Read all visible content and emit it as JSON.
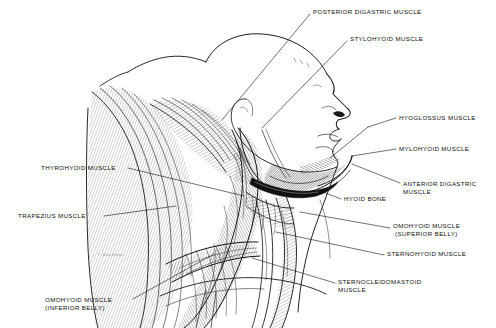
{
  "figure": {
    "background_color": "#ffffff",
    "ink_color": "#111111",
    "signature": "T. Blackman"
  },
  "labels": [
    {
      "id": "posterior-digastric",
      "text": "POSTERIOR DIGASTRIC MUSCLE",
      "x": 313,
      "y": 11,
      "align": "left"
    },
    {
      "id": "stylohyoid",
      "text": "STYLOHYOID MUSCLE",
      "x": 350,
      "y": 38,
      "align": "left"
    },
    {
      "id": "hyoglossus",
      "text": "HYOGLOSSUS MUSCLE",
      "x": 399,
      "y": 117,
      "align": "left"
    },
    {
      "id": "mylohyoid",
      "text": "MYLOHYOID MUSCLE",
      "x": 399,
      "y": 148,
      "align": "left"
    },
    {
      "id": "anterior-digastric",
      "text": "ANTERIOR DIGASTRIC\nMUSCLE",
      "x": 403,
      "y": 184,
      "align": "left"
    },
    {
      "id": "hyoid-bone",
      "text": "HYOID BONE",
      "x": 344,
      "y": 198,
      "align": "left"
    },
    {
      "id": "omohyoid-superior",
      "text": "OMOHYOID MUSCLE\n (SUPERIOR BELLY)",
      "x": 393,
      "y": 226,
      "align": "left"
    },
    {
      "id": "sternohyoid",
      "text": "STERNOHYOID MUSCLE",
      "x": 387,
      "y": 253,
      "align": "left"
    },
    {
      "id": "sternocleidomastoid",
      "text": "STERNOCLEIDOMASTOID\nMUSCLE",
      "x": 338,
      "y": 281,
      "align": "left"
    },
    {
      "id": "thyrohyoid",
      "text": "THYROHYOID MUSCLE",
      "x": 41,
      "y": 167,
      "align": "left"
    },
    {
      "id": "trapezius",
      "text": "TRAPEZIUS MUSCLE",
      "x": 18,
      "y": 215,
      "align": "left"
    },
    {
      "id": "omohyoid-inferior",
      "text": "OMOHYOID MUSCLE\n(INFERIOR BELLY)",
      "x": 45,
      "y": 300,
      "align": "left"
    }
  ],
  "leader_lines": [
    {
      "id": "leader-posterior-digastric",
      "from": [
        310,
        14
      ],
      "to": [
        222,
        120
      ]
    },
    {
      "id": "leader-stylohyoid",
      "from": [
        347,
        41
      ],
      "to": [
        262,
        128
      ]
    },
    {
      "id": "leader-hyoglossus",
      "from": [
        396,
        118
      ],
      "to": [
        368,
        127
      ]
    },
    {
      "id": "leader-mylohyoid",
      "from": [
        396,
        149
      ],
      "to": [
        358,
        153
      ]
    },
    {
      "id": "leader-anterior-digastric",
      "from": [
        400,
        183
      ],
      "to": [
        370,
        164
      ]
    },
    {
      "id": "leader-hyoid-bone",
      "from": [
        341,
        199
      ],
      "to": [
        318,
        190
      ]
    },
    {
      "id": "leader-omohyoid-superior",
      "from": [
        390,
        228
      ],
      "to": [
        352,
        219
      ]
    },
    {
      "id": "leader-sternohyoid",
      "from": [
        384,
        255
      ],
      "to": [
        300,
        233
      ]
    },
    {
      "id": "leader-sternocleidomastoid",
      "from": [
        335,
        283
      ],
      "to": [
        300,
        268
      ]
    },
    {
      "id": "leader-thyrohyoid",
      "from": [
        128,
        168
      ],
      "to": [
        232,
        191
      ]
    },
    {
      "id": "leader-trapezius",
      "from": [
        104,
        216
      ],
      "to": [
        175,
        206
      ]
    },
    {
      "id": "leader-omohyoid-inferior",
      "from": [
        133,
        299
      ],
      "to": [
        213,
        254
      ]
    }
  ]
}
